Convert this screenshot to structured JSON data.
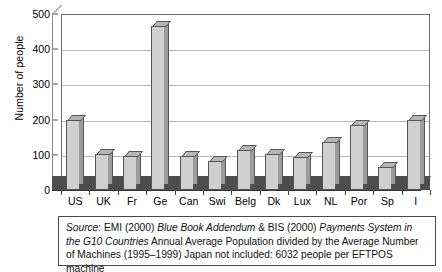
{
  "chart_data": {
    "type": "bar",
    "title": "",
    "xlabel": "",
    "ylabel": "Number of people",
    "ylim": [
      0,
      500
    ],
    "yticks": [
      0,
      100,
      200,
      300,
      400,
      500
    ],
    "grid": true,
    "legend": "none",
    "categories": [
      "US",
      "UK",
      "Fr",
      "Ge",
      "Can",
      "Swi",
      "Belg",
      "Dk",
      "Lux",
      "NL",
      "Por",
      "Sp",
      "I"
    ],
    "values": [
      200,
      103,
      98,
      465,
      98,
      82,
      115,
      102,
      93,
      135,
      185,
      65,
      200
    ],
    "series": [
      {
        "name": "Annual Average Population per EFTPOS machine",
        "values": [
          200,
          103,
          98,
          465,
          98,
          82,
          115,
          102,
          93,
          135,
          185,
          65,
          200
        ]
      }
    ]
  },
  "axis": {
    "y_title": "Number of people",
    "y_tick_labels": [
      "500",
      "400",
      "300",
      "200",
      "100",
      "0"
    ],
    "x_tick_labels": [
      "US",
      "UK",
      "Fr",
      "Ge",
      "Can",
      "Swi",
      "Belg",
      "Dk",
      "Lux",
      "NL",
      "Por",
      "Sp",
      "I"
    ]
  },
  "caption": {
    "source_label": "Source",
    "colon": ":",
    "part1": " EMI (2000) ",
    "italic1": "Blue Book Addendum",
    "part2": " & BIS (2000) ",
    "italic2": "Payments System in the G10 Countries",
    "part3": " Annual Average Population divided by the Average Number of Machines (1995–1999) Japan not included: 6032 people per EFTPOS machine"
  },
  "colors": {
    "bar_face": "#cfcfcf",
    "bar_side": "#9c9c9c",
    "bar_top": "#b6b6b6",
    "bar_outline": "#555555",
    "floor": "#4d4d4d",
    "gridline": "#b9b9b9",
    "panel_border": "#6f6f6f",
    "background": "#ffffff"
  }
}
